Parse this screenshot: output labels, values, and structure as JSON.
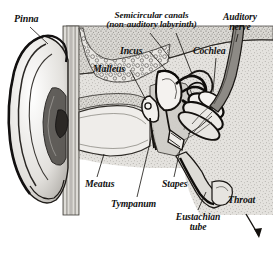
{
  "figure": {
    "background_color": "#ffffff",
    "ink_color": "#111111",
    "tissue_fill": "#d8d6d2",
    "bone_fill": "#e7e5e1"
  },
  "labels": {
    "pinna": "Pinna",
    "semicircular_line1": "Semicircular canals",
    "semicircular_line2": "(non-auditory labyrinth)",
    "auditory_line1": "Auditory",
    "auditory_line2": "nerve",
    "incus": "Incus",
    "cochlea": "Cochlea",
    "malleus": "Malleus",
    "meatus": "Meatus",
    "stapes": "Stapes",
    "tympanum": "Tympanum",
    "throat": "Throat",
    "eustachian_line1": "Eustachian",
    "eustachian_line2": "tube"
  },
  "parts": [
    {
      "id": "pinna",
      "label": "Pinna",
      "region": "outer ear"
    },
    {
      "id": "meatus",
      "label": "Meatus",
      "region": "outer ear"
    },
    {
      "id": "tympanum",
      "label": "Tympanum",
      "region": "middle ear"
    },
    {
      "id": "malleus",
      "label": "Malleus",
      "region": "middle ear"
    },
    {
      "id": "incus",
      "label": "Incus",
      "region": "middle ear"
    },
    {
      "id": "stapes",
      "label": "Stapes",
      "region": "middle ear"
    },
    {
      "id": "eustachian-tube",
      "label": "Eustachian tube",
      "region": "middle ear"
    },
    {
      "id": "semicircular-canals",
      "label": "Semicircular canals",
      "region": "inner ear"
    },
    {
      "id": "cochlea",
      "label": "Cochlea",
      "region": "inner ear"
    },
    {
      "id": "auditory-nerve",
      "label": "Auditory nerve",
      "region": "inner ear"
    },
    {
      "id": "throat",
      "label": "Throat",
      "region": "pharynx"
    }
  ],
  "arrow": {
    "name": "throat-direction-arrow",
    "direction": "down-right"
  }
}
